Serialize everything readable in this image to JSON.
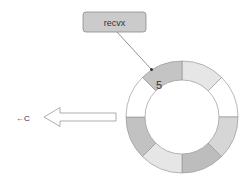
{
  "diagram": {
    "pointer_label": {
      "text": "recvx",
      "fill": "#cbcbcb",
      "stroke": "#8a8a8a"
    },
    "direction_label": {
      "text": "←C"
    },
    "ring": {
      "center": [
        182,
        117
      ],
      "outer_radius": 56,
      "inner_radius": 37,
      "segments": [
        {
          "index": 0,
          "fill": "#e6e6e6",
          "value": ""
        },
        {
          "index": 1,
          "fill": "#ffffff",
          "value": ""
        },
        {
          "index": 2,
          "fill": "#d6d6d6",
          "value": ""
        },
        {
          "index": 3,
          "fill": "#bdbdbd",
          "value": ""
        },
        {
          "index": 4,
          "fill": "#e6e6e6",
          "value": ""
        },
        {
          "index": 5,
          "fill": "#c2c2c2",
          "value": ""
        },
        {
          "index": 6,
          "fill": "#ffffff",
          "value": ""
        },
        {
          "index": 7,
          "fill": "#c4c4c4",
          "value": "5"
        }
      ]
    },
    "highlighted_value": "5"
  }
}
